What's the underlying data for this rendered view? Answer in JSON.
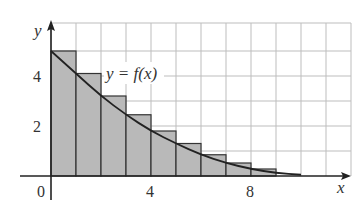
{
  "chart_data": {
    "type": "bar",
    "subtype": "riemann-left-sum-with-curve",
    "title": "",
    "curve_label": "y = f(x)",
    "xlabel": "x",
    "ylabel": "y",
    "x_ticks": [
      {
        "value": 0,
        "label": "0"
      },
      {
        "value": 4,
        "label": "4"
      },
      {
        "value": 8,
        "label": "8"
      }
    ],
    "y_ticks": [
      {
        "value": 2,
        "label": "2"
      },
      {
        "value": 4,
        "label": "4"
      }
    ],
    "xlim": [
      0,
      12
    ],
    "ylim": [
      0,
      6
    ],
    "grid": true,
    "bar_width": 1,
    "categories": [
      "0-1",
      "1-2",
      "2-3",
      "3-4",
      "4-5",
      "5-6",
      "6-7",
      "7-8",
      "8-9"
    ],
    "x_left": [
      0,
      1,
      2,
      3,
      4,
      5,
      6,
      7,
      8
    ],
    "values": [
      5.0,
      4.1,
      3.2,
      2.45,
      1.8,
      1.3,
      0.85,
      0.52,
      0.28
    ],
    "curve_points": [
      [
        0,
        5.0
      ],
      [
        1,
        4.1
      ],
      [
        2,
        3.2
      ],
      [
        3,
        2.45
      ],
      [
        4,
        1.8
      ],
      [
        5,
        1.3
      ],
      [
        6,
        0.85
      ],
      [
        7,
        0.52
      ],
      [
        8,
        0.28
      ],
      [
        9,
        0.12
      ],
      [
        10,
        0.05
      ]
    ],
    "colors": {
      "bar_fill": "#b9b9b9",
      "bar_stroke": "#333333",
      "grid": "#bdbdbd",
      "axis": "#222222",
      "curve": "#222222"
    }
  }
}
